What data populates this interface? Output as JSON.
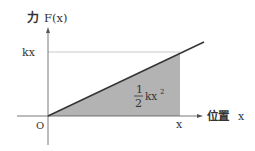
{
  "diagram": {
    "y_axis_label_cjk": "力",
    "y_axis_label": "F(x)",
    "x_axis_label_cjk": "位置",
    "x_axis_label": "x",
    "origin_label": "O",
    "y_tick_label": "kx",
    "x_tick_label": "x",
    "area_numerator": "1",
    "area_denominator": "2",
    "area_expr": "kx",
    "area_exponent": "2",
    "colors": {
      "axis": "#555555",
      "line": "#333333",
      "fill": "#b3b3b3",
      "gridline": "#bbbbbb"
    }
  }
}
